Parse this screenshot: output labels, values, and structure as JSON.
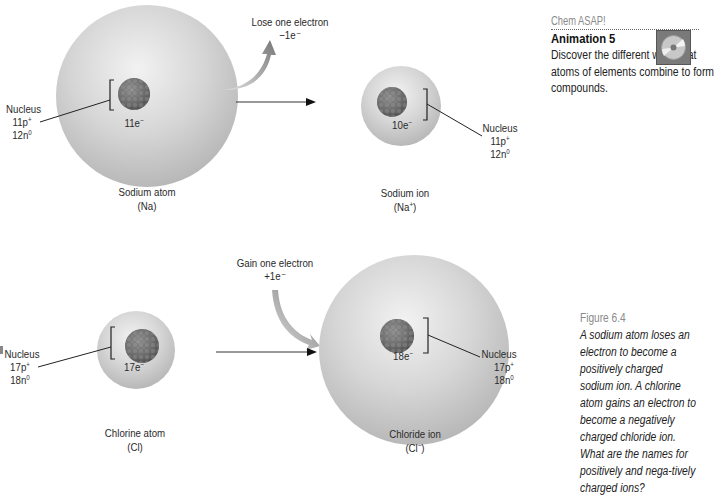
{
  "figure": {
    "top_row": {
      "transition_label": "Lose one electron",
      "transition_amount": "−1e⁻",
      "left": {
        "name": "Sodium atom",
        "symbol": "(Na)",
        "electrons": "11e",
        "nucleus_label": "Nucleus",
        "protons": "11p",
        "neutrons": "12n"
      },
      "right": {
        "name": "Sodium ion",
        "symbol_base": "(Na",
        "symbol_charge": "+",
        "symbol_close": ")",
        "electrons": "10e",
        "nucleus_label": "Nucleus",
        "protons": "11p",
        "neutrons": "12n"
      }
    },
    "bottom_row": {
      "transition_label": "Gain one electron",
      "transition_amount": "+1e⁻",
      "left": {
        "name": "Chlorine atom",
        "symbol": "(Cl)",
        "electrons": "17e",
        "nucleus_label": "Nucleus",
        "protons": "17p",
        "neutrons": "18n"
      },
      "right": {
        "name": "Chloride ion",
        "symbol_base": "(Cl",
        "symbol_charge": "−",
        "symbol_close": ")",
        "electrons": "18e",
        "nucleus_label": "Nucleus",
        "protons": "17p",
        "neutrons": "18n"
      }
    },
    "superscripts": {
      "electron": "−",
      "proton": "+",
      "neutron": "0"
    }
  },
  "sidebar": {
    "section_title": "Chem ASAP!",
    "animation_title": "Animation 5",
    "animation_text": "Discover the different ways that atoms of elements combine to form compounds.",
    "icon": "cd-rom-icon"
  },
  "caption": {
    "label": "Figure 6.4",
    "text": "A sodium atom loses an electron to become a positively charged sodium ion. A chlorine atom gains an electron to become a negatively charged chloride ion. What are the names for positively and nega-tively charged ions?"
  }
}
